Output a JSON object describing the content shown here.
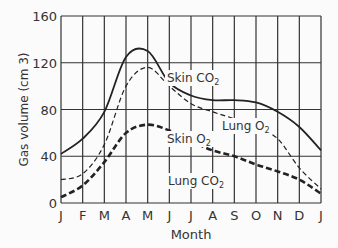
{
  "chart_data": {
    "type": "line",
    "title": "",
    "xlabel": "Month",
    "ylabel": "Gas volume (cm 3)",
    "ylim": [
      0,
      160
    ],
    "yticks": [
      0,
      40,
      80,
      120,
      160
    ],
    "grid": true,
    "categories": [
      "J",
      "F",
      "M",
      "A",
      "M",
      "J",
      "J",
      "A",
      "S",
      "O",
      "N",
      "D",
      "J"
    ],
    "series": [
      {
        "name": "Skin CO2",
        "style": "solid",
        "values": [
          42,
          55,
          78,
          125,
          130,
          103,
          92,
          88,
          88,
          86,
          78,
          65,
          45
        ]
      },
      {
        "name": "Lung O2",
        "style": "thin-dashed",
        "values": [
          20,
          25,
          50,
          100,
          116,
          100,
          85,
          78,
          72,
          65,
          55,
          30,
          12
        ]
      },
      {
        "name": "Skin O2 / Lung CO2",
        "style": "thick-dashed",
        "values": [
          5,
          15,
          35,
          60,
          67,
          62,
          53,
          45,
          40,
          33,
          27,
          20,
          8
        ]
      }
    ],
    "annotations": [
      {
        "text": "Skin CO",
        "sub": "2",
        "near": "O"
      },
      {
        "text": "Lung O",
        "sub": "2",
        "near": "S"
      },
      {
        "text": "Skin O",
        "sub": "2",
        "near": "J"
      },
      {
        "text": "Lung CO",
        "sub": "2",
        "near": "S"
      }
    ]
  }
}
